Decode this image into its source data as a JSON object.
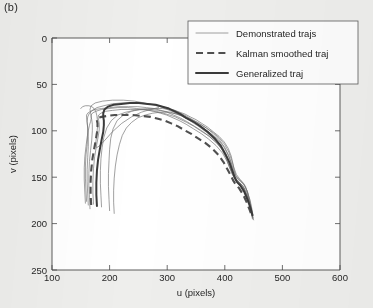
{
  "panel": {
    "label": "(b)"
  },
  "chart_data": {
    "type": "line",
    "title": "",
    "xlabel": "u (pixels)",
    "ylabel": "v (pixels)",
    "xlim": [
      100,
      600
    ],
    "ylim": [
      0,
      250
    ],
    "y_inverted": true,
    "xticks": [
      100,
      200,
      300,
      400,
      500,
      600
    ],
    "yticks": [
      0,
      50,
      100,
      150,
      200,
      250
    ],
    "grid": false,
    "legend_position": "top-right",
    "legend": [
      {
        "label": "Demonstrated trajs",
        "style": "thin-solid",
        "color": "#6d6d6d"
      },
      {
        "label": "Kalman smoothed traj",
        "style": "thick-dashed",
        "color": "#4f4f4f"
      },
      {
        "label": "Generalized traj",
        "style": "thick-solid",
        "color": "#3a3a3a"
      }
    ],
    "series": [
      {
        "name": "Demonstrated trajs",
        "style": "thin-solid",
        "traces": [
          {
            "name": "demo-1",
            "u": [
              200,
              199,
              198,
              198,
              199,
              200,
              202,
              206,
              213,
              224,
              238,
              252,
              266,
              280,
              292,
              303,
              313,
              322,
              331,
              340,
              350,
              360,
              370,
              380,
              390,
              399,
              406,
              411,
              414,
              416,
              419,
              424,
              430,
              436,
              440,
              443,
              445,
              446,
              447,
              448
            ],
            "v": [
              186,
              174,
              160,
              146,
              132,
              120,
              108,
              98,
              89,
              83,
              79,
              77,
              76,
              76,
              76,
              77,
              78,
              80,
              82,
              85,
              88,
              92,
              96,
              101,
              106,
              112,
              119,
              127,
              135,
              142,
              148,
              152,
              155,
              160,
              168,
              176,
              183,
              188,
              192,
              195
            ]
          },
          {
            "name": "demo-2",
            "u": [
              186,
              185,
              184,
              184,
              185,
              187,
              190,
              195,
              203,
              214,
              228,
              243,
              258,
              272,
              285,
              296,
              306,
              316,
              325,
              335,
              345,
              356,
              367,
              378,
              389,
              398,
              405,
              410,
              413,
              416,
              420,
              426,
              432,
              438,
              442,
              445,
              447,
              448
            ],
            "v": [
              182,
              170,
              157,
              143,
              130,
              118,
              107,
              97,
              89,
              83,
              80,
              78,
              77,
              77,
              78,
              79,
              80,
              82,
              84,
              87,
              90,
              94,
              99,
              104,
              110,
              117,
              125,
              133,
              141,
              147,
              152,
              156,
              160,
              166,
              174,
              182,
              189,
              193
            ]
          },
          {
            "name": "demo-3",
            "u": [
              163,
              162,
              161,
              161,
              162,
              163,
              163,
              162,
              161,
              162,
              165,
              170,
              178,
              190,
              204,
              220,
              236,
              252,
              267,
              280,
              292,
              303,
              313,
              323,
              333,
              344,
              356,
              368,
              380,
              391,
              400,
              407,
              412,
              416,
              420,
              426,
              433,
              439,
              443,
              446,
              448,
              449
            ],
            "v": [
              180,
              168,
              155,
              142,
              129,
              117,
              106,
              97,
              90,
              85,
              81,
              78,
              75,
              73,
              71,
              70,
              70,
              70,
              71,
              72,
              74,
              76,
              78,
              81,
              84,
              88,
              92,
              97,
              103,
              110,
              118,
              127,
              136,
              144,
              150,
              154,
              158,
              165,
              174,
              183,
              190,
              194
            ]
          },
          {
            "name": "demo-4",
            "u": [
              160,
              159,
              158,
              158,
              159,
              161,
              162,
              162,
              161,
              160,
              160,
              162,
              167,
              175,
              186,
              200,
              216,
              233,
              249,
              264,
              277,
              289,
              300,
              311,
              322,
              334,
              347,
              360,
              373,
              386,
              396,
              404,
              410,
              414,
              418,
              424,
              431,
              437,
              442,
              445,
              447
            ],
            "v": [
              176,
              164,
              151,
              138,
              126,
              115,
              105,
              97,
              91,
              86,
              83,
              81,
              79,
              77,
              76,
              75,
              74,
              74,
              74,
              75,
              76,
              78,
              80,
              83,
              86,
              90,
              95,
              100,
              106,
              113,
              121,
              130,
              139,
              146,
              151,
              155,
              159,
              167,
              176,
              184,
              190
            ]
          },
          {
            "name": "demo-5",
            "u": [
              166,
              165,
              164,
              164,
              165,
              167,
              169,
              170,
              170,
              169,
              168,
              168,
              170,
              176,
              186,
              199,
              214,
              231,
              247,
              262,
              276,
              288,
              299,
              310,
              321,
              333,
              346,
              359,
              372,
              385,
              396,
              404,
              410,
              415,
              419,
              425,
              432,
              438,
              443,
              446,
              448,
              450
            ],
            "v": [
              184,
              172,
              159,
              146,
              133,
              121,
              110,
              100,
              93,
              88,
              85,
              83,
              81,
              79,
              77,
              76,
              75,
              75,
              76,
              77,
              79,
              81,
              83,
              86,
              89,
              93,
              98,
              103,
              109,
              116,
              124,
              133,
              142,
              149,
              154,
              158,
              162,
              170,
              179,
              187,
              193,
              196
            ]
          },
          {
            "name": "demo-6",
            "u": [
              172,
              171,
              171,
              172,
              174,
              177,
              180,
              182,
              182,
              181,
              180,
              181,
              185,
              193,
              205,
              220,
              236,
              252,
              267,
              281,
              293,
              304,
              314,
              324,
              334,
              346,
              358,
              371,
              384,
              395,
              403,
              409,
              413,
              417,
              421,
              427,
              434,
              440,
              444,
              447,
              449
            ],
            "v": [
              179,
              167,
              154,
              141,
              128,
              117,
              107,
              99,
              93,
              89,
              86,
              83,
              81,
              79,
              78,
              77,
              77,
              77,
              78,
              79,
              81,
              83,
              85,
              88,
              91,
              95,
              100,
              105,
              112,
              119,
              127,
              136,
              144,
              150,
              155,
              159,
              164,
              172,
              181,
              189,
              194
            ]
          },
          {
            "name": "demo-7",
            "u": [
              158,
              157,
              156,
              156,
              157,
              159,
              161,
              163,
              165,
              167,
              168,
              168,
              167,
              166,
              168,
              175,
              188,
              205,
              224,
              243,
              260,
              275,
              288,
              300,
              312,
              325,
              339,
              354,
              369,
              383,
              394,
              402,
              408,
              413,
              418,
              425,
              432,
              438,
              443,
              446
            ],
            "v": [
              178,
              166,
              153,
              140,
              128,
              117,
              107,
              100,
              94,
              90,
              87,
              84,
              81,
              77,
              73,
              70,
              68,
              67,
              67,
              68,
              70,
              72,
              74,
              77,
              80,
              84,
              89,
              95,
              102,
              110,
              119,
              129,
              139,
              147,
              152,
              156,
              161,
              169,
              178,
              186
            ]
          },
          {
            "name": "demo-8",
            "u": [
              208,
              207,
              207,
              208,
              210,
              213,
              217,
              222,
              229,
              238,
              249,
              262,
              275,
              288,
              299,
              309,
              318,
              327,
              336,
              346,
              357,
              368,
              380,
              391,
              400,
              407,
              412,
              416,
              420,
              426,
              433,
              439,
              444,
              447,
              449
            ],
            "v": [
              189,
              177,
              164,
              151,
              138,
              126,
              115,
              105,
              97,
              91,
              86,
              83,
              81,
              80,
              80,
              81,
              82,
              84,
              86,
              89,
              93,
              97,
              102,
              108,
              115,
              123,
              132,
              140,
              147,
              152,
              157,
              165,
              175,
              184,
              191
            ]
          },
          {
            "name": "demo-9-hook",
            "u": [
              150,
              153,
              158,
              164,
              169,
              173,
              176,
              178,
              179,
              179,
              178,
              177,
              176,
              176,
              178,
              183,
              192,
              205,
              221,
              238,
              255,
              271,
              285
            ],
            "v": [
              76,
              74,
              73,
              73,
              74,
              76,
              79,
              84,
              90,
              96,
              102,
              108,
              113,
              117,
              118,
              116,
              110,
              101,
              92,
              85,
              80,
              77,
              75
            ]
          }
        ]
      },
      {
        "name": "Kalman smoothed traj",
        "style": "thick-dashed",
        "u": [
          168,
          167,
          167,
          168,
          170,
          173,
          176,
          178,
          179,
          179,
          178,
          178,
          180,
          186,
          196,
          209,
          224,
          240,
          256,
          271,
          284,
          296,
          307,
          318,
          329,
          341,
          353,
          366,
          378,
          389,
          398,
          405,
          411,
          415,
          419,
          425,
          432,
          438,
          443,
          446
        ],
        "v": [
          180,
          168,
          155,
          143,
          131,
          120,
          110,
          102,
          96,
          92,
          89,
          87,
          86,
          85,
          84,
          83,
          83,
          83,
          84,
          85,
          87,
          89,
          92,
          95,
          99,
          103,
          108,
          113,
          119,
          126,
          134,
          142,
          149,
          154,
          158,
          162,
          169,
          177,
          185,
          190
        ]
      },
      {
        "name": "Generalized traj",
        "style": "thick-solid",
        "u": [
          178,
          177,
          177,
          178,
          180,
          183,
          186,
          189,
          190,
          190,
          189,
          189,
          191,
          197,
          207,
          220,
          235,
          251,
          266,
          280,
          292,
          303,
          313,
          323,
          333,
          345,
          357,
          370,
          382,
          393,
          401,
          408,
          413,
          417,
          421,
          427,
          434,
          440,
          445,
          448
        ],
        "v": [
          181,
          169,
          156,
          143,
          131,
          120,
          110,
          101,
          94,
          89,
          85,
          81,
          77,
          74,
          72,
          71,
          70,
          70,
          71,
          72,
          74,
          76,
          79,
          82,
          86,
          90,
          95,
          101,
          108,
          116,
          125,
          134,
          143,
          150,
          155,
          159,
          166,
          175,
          184,
          191
        ]
      }
    ]
  }
}
